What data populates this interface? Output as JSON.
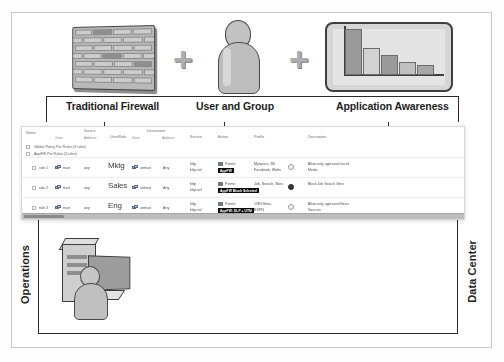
{
  "diagram": {
    "top_icons": [
      {
        "name": "firewall-brick-icon",
        "label": "brick-wall"
      },
      {
        "name": "plus-operator",
        "label": "+"
      },
      {
        "name": "user-person-icon",
        "label": "person"
      },
      {
        "name": "plus-operator-2",
        "label": "+"
      },
      {
        "name": "application-chart-icon",
        "label": "bar-chart"
      }
    ],
    "component_labels": [
      "Traditional Firewall",
      "User and Group",
      "Application Awareness"
    ],
    "zone_labels": {
      "left": "Operations",
      "right": "Data Center"
    }
  },
  "policy_table": {
    "headers_top": [
      "Name",
      "Source",
      "User/Role",
      "Destination",
      "Service",
      "Action",
      "Profile",
      "Description"
    ],
    "headers_sub": [
      "Zone",
      "Address",
      "Zone",
      "Address"
    ],
    "group_rows": [
      "Global Policy Pre Rules (3 rules)",
      "AppFW Pre Rules (3 rules)"
    ],
    "rows": [
      {
        "name": "rule 1",
        "src_zone": "trust",
        "src_address": "any",
        "user_role": "Mktg",
        "dst_zone": "untrust",
        "dst_address": "Any",
        "service": [
          "http",
          "http-ssl"
        ],
        "action": "Permit",
        "action_badge": "AppFW",
        "apps": [
          "Myspace, IM,",
          "Facebook, Webs"
        ],
        "description": [
          "Allow only approved social",
          "Media"
        ]
      },
      {
        "name": "rule 2",
        "src_zone": "trust",
        "src_address": "any",
        "user_role": "Sales",
        "dst_zone": "untrust",
        "dst_address": "Any",
        "service": [
          "http",
          "http-ssl"
        ],
        "action": "Permit",
        "action_badge": "AppFW Block Selected",
        "apps": [
          "Job, Search, Sites"
        ],
        "description": [
          "Block Job Search Sites"
        ]
      },
      {
        "name": "rule 3",
        "src_zone": "trust",
        "src_address": "any",
        "user_role": "Eng",
        "dst_zone": "untrust",
        "dst_address": "Any",
        "service": [
          "http",
          "http-ssl"
        ],
        "action": "Permit",
        "action_badge": "AppFW: DLP + UTM",
        "apps": [
          "CNN Sites,",
          "ESPN"
        ],
        "description": [
          "Allow only approved News",
          "Sources"
        ]
      }
    ]
  },
  "chart_data": {
    "type": "bar",
    "title": "",
    "categories": [
      "1",
      "2",
      "3",
      "4",
      "5"
    ],
    "values": [
      48,
      28,
      21,
      14,
      10
    ],
    "xlabel": "",
    "ylabel": "",
    "ylim": [
      0,
      50
    ]
  },
  "colors": {
    "frame": "#c9c9c9",
    "bracket": "#2a2a2a",
    "badge_bg": "#0d0d0d",
    "badge_fg": "#ffffff",
    "icon_gray": "#bdbdbd"
  }
}
